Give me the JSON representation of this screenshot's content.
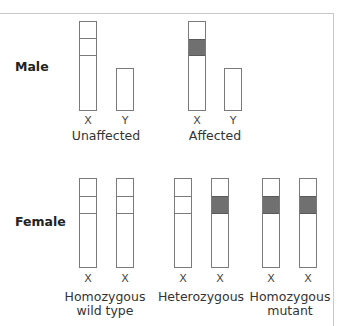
{
  "rows": {
    "male": {
      "label": "Male"
    },
    "female": {
      "label": "Female"
    }
  },
  "male_groups": [
    {
      "caption": "Unaffected",
      "chromosomes": [
        {
          "letter": "X",
          "type": "normal"
        },
        {
          "letter": "Y",
          "type": "y"
        }
      ]
    },
    {
      "caption": "Affected",
      "chromosomes": [
        {
          "letter": "X",
          "type": "mutant"
        },
        {
          "letter": "Y",
          "type": "y"
        }
      ]
    }
  ],
  "female_groups": [
    {
      "caption_line1": "Homozygous",
      "caption_line2": "wild type",
      "chromosomes": [
        {
          "letter": "X",
          "type": "normal"
        },
        {
          "letter": "X",
          "type": "normal"
        }
      ]
    },
    {
      "caption_line1": "Heterozygous",
      "caption_line2": "",
      "chromosomes": [
        {
          "letter": "X",
          "type": "normal"
        },
        {
          "letter": "X",
          "type": "mutant"
        }
      ]
    },
    {
      "caption_line1": "Homozygous",
      "caption_line2": "mutant",
      "chromosomes": [
        {
          "letter": "X",
          "type": "mutant"
        },
        {
          "letter": "X",
          "type": "mutant"
        }
      ]
    }
  ],
  "colors": {
    "outline": "#7a7a7a",
    "mutant_band": "#707070",
    "frame": "#c9c9c9"
  }
}
